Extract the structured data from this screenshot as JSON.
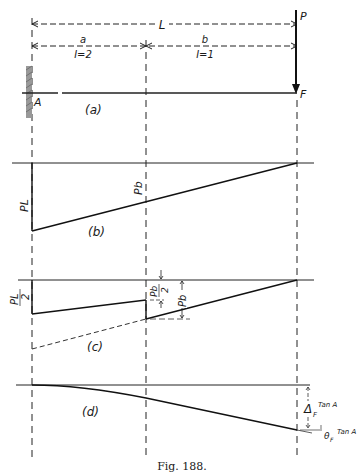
{
  "figure": {
    "caption": "Fig. 188.",
    "panels": {
      "a": {
        "label": "(a)",
        "support_label": "A",
        "free_end_label": "F",
        "load_label": "P",
        "span_label": "L",
        "segment_a_label": "a",
        "segment_a_inertia": "I=2",
        "segment_b_label": "b",
        "segment_b_inertia": "I=1"
      },
      "b": {
        "label": "(b)",
        "left_ordinate_label": "PL",
        "mid_ordinate_label": "Pb"
      },
      "c": {
        "label": "(c)",
        "left_ordinate_num": "PL",
        "left_ordinate_den": "2",
        "mid_step_num": "Pb",
        "mid_step_den": "2",
        "mid_ordinate_label": "Pb"
      },
      "d": {
        "label": "(d)",
        "deflection_label": "Δ",
        "deflection_sub": "F",
        "rotation_label": "θ",
        "rotation_sub": "F",
        "tangent_label_1": "Tan A",
        "tangent_label_2": "Tan A"
      }
    }
  }
}
